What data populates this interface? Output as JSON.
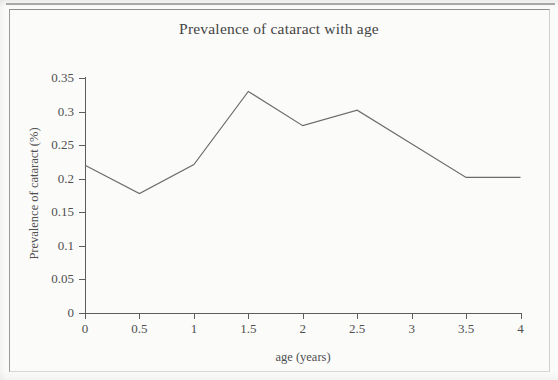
{
  "figure": {
    "title": "Prevalence of cataract with age"
  },
  "chart_data": {
    "type": "line",
    "title": "Prevalence of cataract with age",
    "xlabel": "age (years)",
    "ylabel": "Prevalence of cataract (%)",
    "xlim": [
      0,
      4
    ],
    "ylim": [
      0,
      0.35
    ],
    "grid": false,
    "legend": null,
    "x_ticks": [
      "0",
      "0.5",
      "1",
      "1.5",
      "2",
      "2.5",
      "3",
      "3.5",
      "4"
    ],
    "x_tick_values": [
      0,
      0.5,
      1,
      1.5,
      2,
      2.5,
      3,
      3.5,
      4
    ],
    "y_ticks": [
      "0",
      "0.05",
      "0.1",
      "0.15",
      "0.2",
      "0.25",
      "0.3",
      "0.35"
    ],
    "y_tick_values": [
      0,
      0.05,
      0.1,
      0.15,
      0.2,
      0.25,
      0.3,
      0.35
    ],
    "x": [
      0,
      0.5,
      1,
      1.5,
      2,
      2.5,
      3.5,
      4
    ],
    "values": [
      0.22,
      0.178,
      0.221,
      0.33,
      0.279,
      0.302,
      0.202,
      0.202
    ],
    "series": [
      {
        "name": "Prevalence of cataract",
        "x": [
          0,
          0.5,
          1,
          1.5,
          2,
          2.5,
          3.5,
          4
        ],
        "values": [
          0.22,
          0.178,
          0.221,
          0.33,
          0.279,
          0.302,
          0.202,
          0.202
        ],
        "color": "#6b6b6b"
      }
    ]
  }
}
